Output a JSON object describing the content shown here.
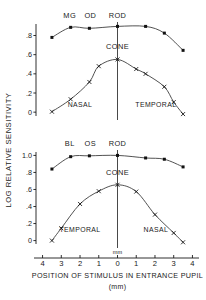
{
  "figure": {
    "ylabel": "LOG RELATIVE SENSITIVITY",
    "xlabel": "POSITION OF STIMULUS IN  ENTRANCE PUPIL",
    "xunits": "(mm)",
    "center_unit_label": "mm",
    "axis_color": "#1a1a1a",
    "curve_color": "#333333",
    "marker_color": "#111111"
  },
  "panels": [
    {
      "id": "top",
      "subject_label": "MG",
      "eye_label": "OD",
      "rod_label": "ROD",
      "cone_label": "CONE",
      "left_region_label": "NASAL",
      "right_region_label": "TEMPORAL",
      "yticks": [
        "0",
        ".2",
        ".4",
        ".6",
        ".8"
      ],
      "ytick_values": [
        0,
        0.2,
        0.4,
        0.6,
        0.8
      ],
      "ylim": [
        -0.04,
        0.92
      ]
    },
    {
      "id": "bottom",
      "subject_label": "BL",
      "eye_label": "OS",
      "rod_label": "ROD",
      "cone_label": "CONE",
      "left_region_label": "TEMPORAL",
      "right_region_label": "NASAL",
      "yticks": [
        "0",
        ".2",
        ".4",
        ".6",
        ".8",
        "1.0"
      ],
      "ytick_values": [
        0,
        0.2,
        0.4,
        0.6,
        0.8,
        1.0
      ],
      "ylim": [
        -0.04,
        1.04
      ]
    }
  ],
  "xaxis": {
    "ticks": [
      "4",
      "3",
      "2",
      "1",
      "0",
      "1",
      "2",
      "3",
      "4"
    ],
    "tick_values": [
      -4,
      -3,
      -2,
      -1,
      0,
      1,
      2,
      3,
      4
    ],
    "xlim": [
      -4.35,
      4.35
    ]
  },
  "chart_data": {
    "type": "scatter",
    "title": "",
    "xlabel": "POSITION OF STIMULUS IN ENTRANCE PUPIL (mm)",
    "ylabel": "LOG RELATIVE SENSITIVITY",
    "xlim": [
      -4.35,
      4.35
    ],
    "grid": false,
    "legend": "none",
    "panels": [
      {
        "name": "MG OD",
        "ylim": [
          -0.04,
          0.92
        ],
        "yticks": [
          0,
          0.2,
          0.4,
          0.6,
          0.8
        ],
        "xticks": [
          -4,
          -3,
          -2,
          -1,
          0,
          1,
          2,
          3,
          4
        ],
        "xticklabels": [
          "4",
          "3",
          "2",
          "1",
          "0",
          "1",
          "2",
          "3",
          "4"
        ],
        "left_region": "NASAL",
        "right_region": "TEMPORAL",
        "series": [
          {
            "name": "ROD",
            "marker": "filled-square",
            "x": [
              -3.5,
              -2.5,
              -1.5,
              0.0,
              1.5,
              2.5,
              3.5
            ],
            "y": [
              0.78,
              0.885,
              0.875,
              0.895,
              0.895,
              0.825,
              0.645
            ]
          },
          {
            "name": "CONE",
            "marker": "cross-x",
            "x": [
              -3.5,
              -2.5,
              -1.5,
              -1.0,
              0.0,
              1.0,
              1.5,
              2.5,
              3.0,
              3.5
            ],
            "y": [
              0.005,
              0.135,
              0.315,
              0.48,
              0.55,
              0.45,
              0.4,
              0.265,
              0.105,
              -0.02
            ]
          }
        ]
      },
      {
        "name": "BL OS",
        "ylim": [
          -0.04,
          1.04
        ],
        "yticks": [
          0,
          0.2,
          0.4,
          0.6,
          0.8,
          1.0
        ],
        "xticks": [
          -4,
          -3,
          -2,
          -1,
          0,
          1,
          2,
          3,
          4
        ],
        "xticklabels": [
          "4",
          "3",
          "2",
          "1",
          "0",
          "1",
          "2",
          "3",
          "4"
        ],
        "left_region": "TEMPORAL",
        "right_region": "NASAL",
        "series": [
          {
            "name": "ROD",
            "marker": "filled-square",
            "x": [
              -3.5,
              -2.5,
              -1.5,
              0.0,
              1.5,
              2.5,
              3.5
            ],
            "y": [
              0.84,
              0.985,
              0.995,
              1.0,
              0.97,
              0.955,
              0.865
            ]
          },
          {
            "name": "CONE",
            "marker": "cross-x",
            "x": [
              -3.5,
              -3.0,
              -2.0,
              -1.0,
              0.0,
              1.0,
              2.0,
              3.0,
              3.5
            ],
            "y": [
              0.0,
              0.145,
              0.43,
              0.58,
              0.655,
              0.575,
              0.305,
              0.09,
              -0.02
            ]
          }
        ]
      }
    ]
  }
}
